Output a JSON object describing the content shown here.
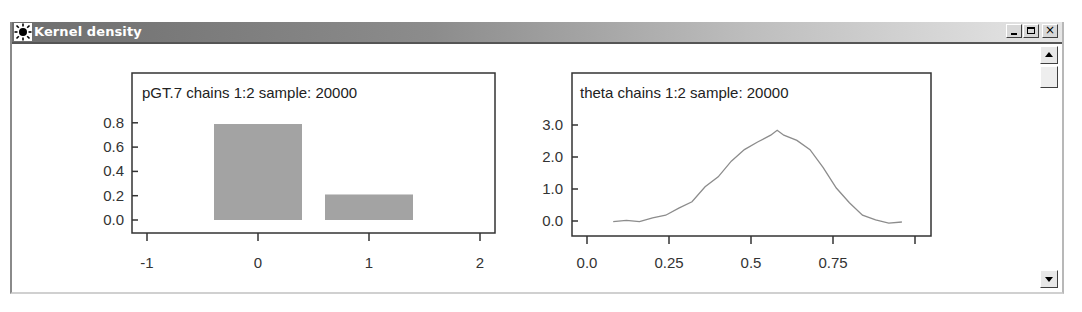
{
  "window": {
    "title": "Kernel density",
    "icon": "sun-icon",
    "controls": [
      "minimize",
      "maximize",
      "close"
    ]
  },
  "scrollbar": {
    "up": "scroll-up-arrow",
    "down": "scroll-down-arrow"
  },
  "colors": {
    "bar_fill": "#a3a3a3",
    "curve": "#8c8c8c",
    "frame": "#333333",
    "titlebar_start": "#6e6e6e",
    "titlebar_end": "#e6e6e6"
  },
  "chart_data": [
    {
      "type": "bar",
      "title": "pGT.7 chains 1:2 sample: 20000",
      "xlabel": "",
      "ylabel": "",
      "categories": [
        "0",
        "1"
      ],
      "x": [
        0,
        1
      ],
      "values": [
        0.79,
        0.21
      ],
      "xlim": [
        -1.15,
        2.15
      ],
      "ylim": [
        0.0,
        0.8
      ],
      "x_ticks": [
        "-1",
        "0",
        "1",
        "2"
      ],
      "y_ticks": [
        "0.0",
        "0.2",
        "0.4",
        "0.6",
        "0.8"
      ],
      "grid": false,
      "legend": null
    },
    {
      "type": "line",
      "title": "theta chains 1:2 sample: 20000",
      "xlabel": "",
      "ylabel": "",
      "x": [
        0.08,
        0.12,
        0.16,
        0.2,
        0.24,
        0.28,
        0.32,
        0.36,
        0.4,
        0.44,
        0.48,
        0.52,
        0.56,
        0.58,
        0.6,
        0.64,
        0.68,
        0.72,
        0.76,
        0.8,
        0.84,
        0.88,
        0.92,
        0.96
      ],
      "values": [
        0.0,
        0.0,
        0.0,
        0.08,
        0.2,
        0.38,
        0.62,
        1.05,
        1.4,
        1.85,
        2.25,
        2.45,
        2.7,
        2.82,
        2.7,
        2.5,
        2.25,
        1.65,
        1.05,
        0.55,
        0.2,
        0.02,
        -0.05,
        -0.05
      ],
      "xlim": [
        -0.05,
        1.05
      ],
      "ylim": [
        0.0,
        3.0
      ],
      "x_ticks": [
        "0.0",
        "0.25",
        "0.5",
        "0.75",
        ""
      ],
      "y_ticks": [
        "0.0",
        "1.0",
        "2.0",
        "3.0"
      ],
      "grid": false,
      "legend": null
    }
  ]
}
